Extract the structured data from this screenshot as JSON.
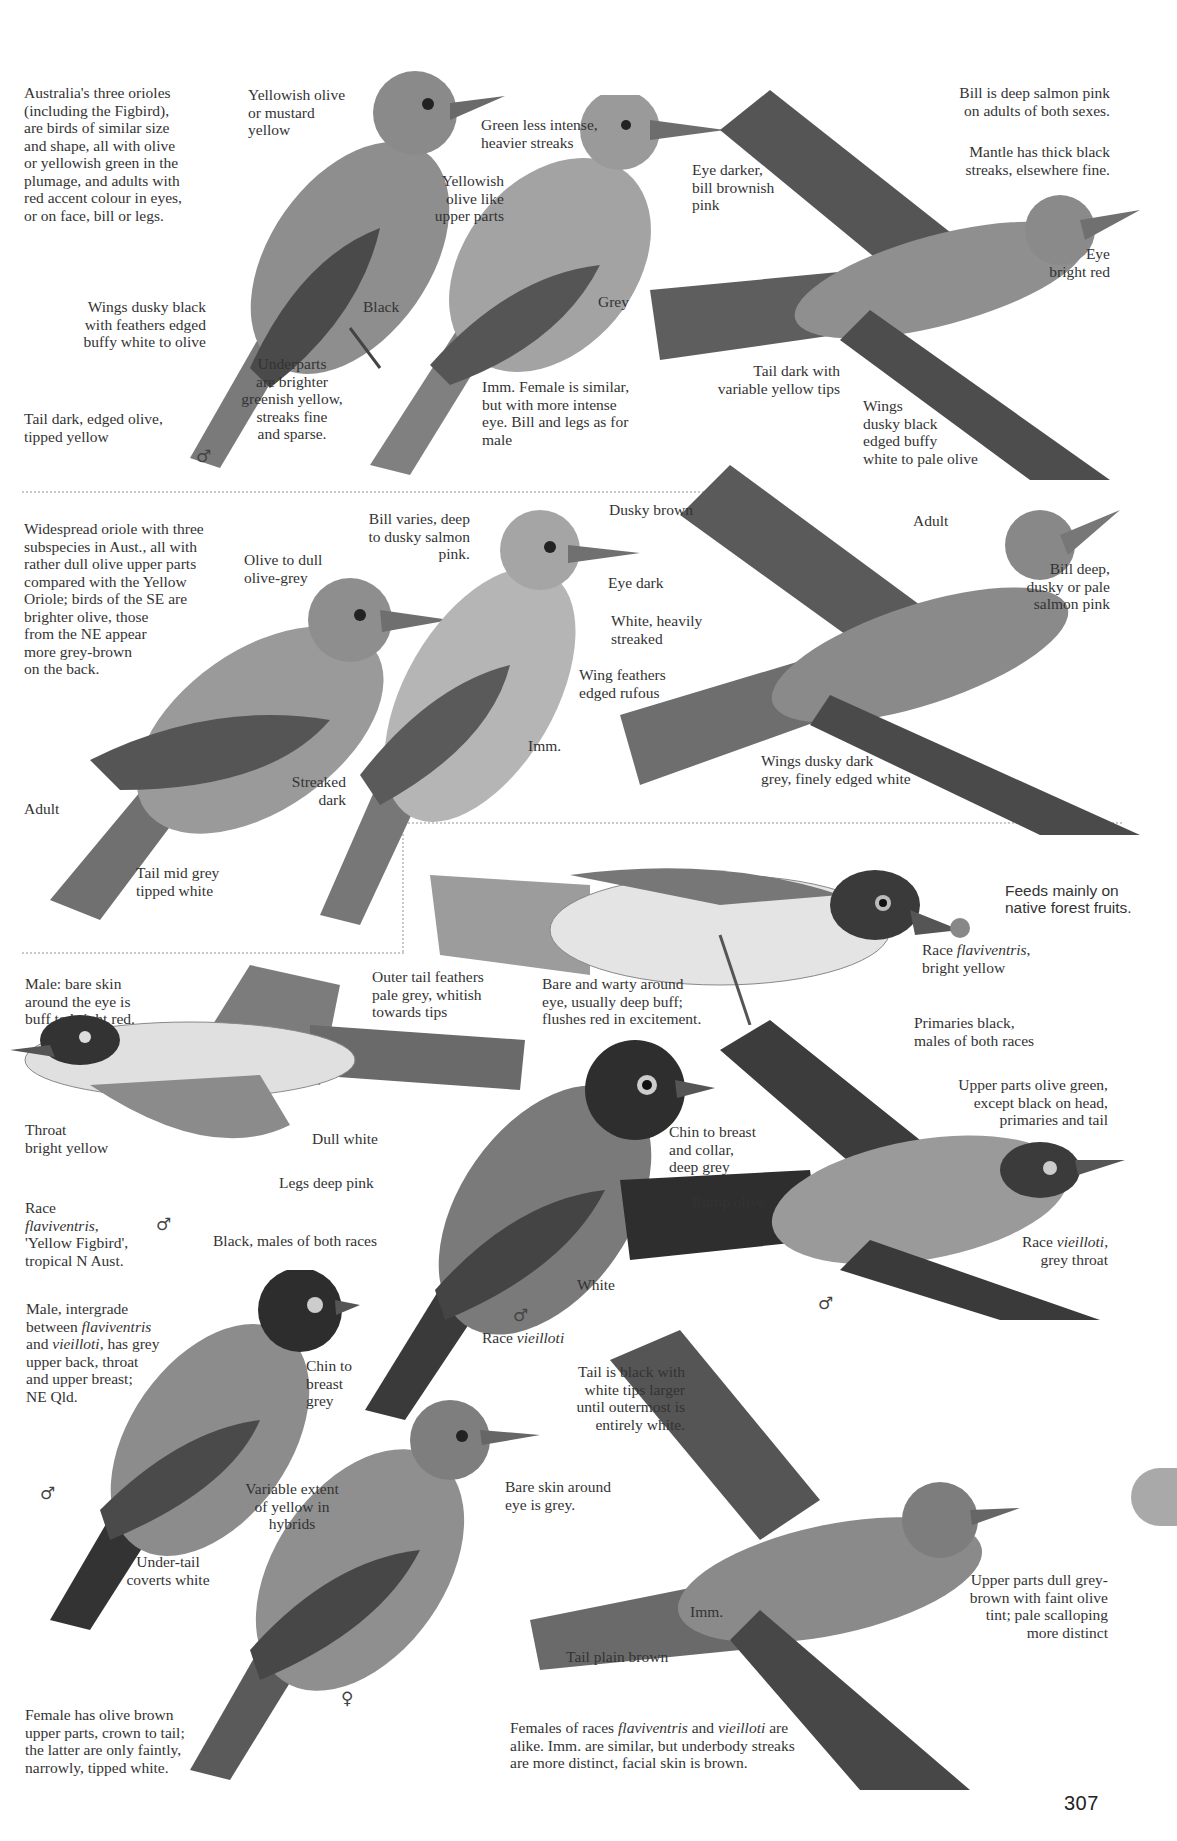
{
  "page": {
    "number": "307",
    "thumb_tab_color": "#a9a9a9",
    "ink_color": "#333333"
  },
  "section1": {
    "intro": "Australia's three orioles\n(including the Figbird),\nare birds of similar size\nand shape, all with olive\nor yellowish green in the\nplumage, and adults with\nred accent colour in eyes,\nor on face, bill or legs.",
    "labels": {
      "yellowish_olive": "Yellowish olive\nor mustard\nyellow",
      "wings_dusky": "Wings dusky black\nwith feathers edged\nbuffy white to olive",
      "black": "Black",
      "underparts": "Underparts\nare brighter\ngreenish yellow,\nstreaks fine\nand sparse.",
      "tail_dark": "Tail dark, edged olive,\ntipped yellow",
      "male_symbol": "♂",
      "green_less": "Green less intense,\nheavier streaks",
      "yellowish_olive_like": "Yellowish\nolive like\nupper parts",
      "eye_darker": "Eye darker,\nbill brownish\npink",
      "grey": "Grey",
      "imm_female": "Imm. Female is similar,\nbut with more intense\neye. Bill and legs as for\nmale",
      "bill_deep_salmon": "Bill is deep salmon pink\non adults of both sexes.",
      "mantle": "Mantle has thick black\nstreaks, elsewhere fine.",
      "eye_bright_red": "Eye\nbright red",
      "tail_dark_with": "Tail dark with\nvariable yellow tips",
      "wings_flight": "Wings\ndusky black\nedged buffy\nwhite to pale olive"
    }
  },
  "section2": {
    "intro": "Widespread oriole with three\nsubspecies in Aust., all with\nrather dull olive upper parts\ncompared with the Yellow\nOriole; birds of the SE are\nbrighter olive, those\nfrom the NE appear\nmore grey-brown\non the back.",
    "labels": {
      "olive_to_dull": "Olive to dull\nolive-grey",
      "bill_varies": "Bill varies, deep\nto dusky salmon\npink.",
      "streaked_dark": "Streaked\ndark",
      "adult_left": "Adult",
      "tail_mid_grey": "Tail mid grey\ntipped white",
      "dusky_brown": "Dusky brown",
      "eye_dark": "Eye dark",
      "white_heavily": "White, heavily\nstreaked",
      "wing_feathers": "Wing feathers\nedged rufous",
      "imm": "Imm.",
      "adult_flight": "Adult",
      "bill_deep_dusky": "Bill deep,\ndusky or pale\nsalmon pink",
      "wings_dusky_dark": "Wings dusky dark\ngrey, finely edged white"
    }
  },
  "section3": {
    "labels": {
      "feeds_mainly": "Feeds mainly on\nnative forest fruits.",
      "race_flaviventris_prefix": "Race ",
      "race_flaviventris_name": "flaviventris",
      "race_flaviventris_suffix": ",\nbright yellow",
      "outer_tail": "Outer tail feathers\npale grey, whitish\ntowards tips",
      "bare_warty": "Bare and warty around\neye, usually deep buff;\nflushes red in excitement.",
      "male_bare_skin": "Male: bare skin\naround the eye is\nbuff to bright red.",
      "throat": "Throat\nbright yellow",
      "dull_white": "Dull white",
      "legs_deep_pink": "Legs deep pink",
      "race_yellow_figbird_prefix": "Race\n",
      "race_yellow_figbird_name": "flaviventris",
      "race_yellow_figbird_suffix": ",\n'Yellow Figbird',\ntropical N Aust.",
      "male_symbol_flight": "♂",
      "black_males": "Black, males of both races",
      "chin_breast_collar": "Chin to breast\nand collar,\ndeep grey",
      "primaries_black": "Primaries black,\nmales of both races",
      "upper_parts_olive": "Upper parts olive green,\nexcept black on head,\nprimaries and tail",
      "rump_olive": "Rump olive",
      "race_vieilloti_grey_prefix": "Race ",
      "race_vieilloti_grey_name": "vieilloti",
      "race_vieilloti_grey_suffix": ",\ngrey throat",
      "male_symbol_vieilloti_flight": "♂",
      "male_intergrade_1": "Male, intergrade\nbetween ",
      "male_intergrade_name1": "flaviventris",
      "male_intergrade_2": "\nand ",
      "male_intergrade_name2": "vieilloti",
      "male_intergrade_3": ", has grey\nupper back, throat\nand upper breast;\nNE Qld.",
      "chin_to_breast_grey": "Chin to\nbreast\ngrey",
      "white": "White",
      "race_vieilloti_prefix": "Race ",
      "race_vieilloti_name": "vieilloti",
      "male_symbol_vieilloti": "♂",
      "male_symbol_intergrade": "♂",
      "tail_is_black": "Tail is black with\nwhite tips larger\nuntil outermost is\nentirely white.",
      "variable_extent": "Variable extent\nof yellow in\nhybrids",
      "under_tail": "Under-tail\ncoverts white",
      "bare_skin_grey": "Bare skin around\neye is grey.",
      "imm_flight": "Imm.",
      "upper_parts_dull": "Upper parts dull grey-\nbrown with faint olive\ntint; pale scalloping\nmore distinct",
      "tail_plain_brown": "Tail plain brown",
      "female_symbol": "♀",
      "female_olive_brown": "Female has olive brown\nupper parts, crown to tail;\nthe latter are only faintly,\nnarrowly, tipped white.",
      "females_races_1": "Females of races ",
      "females_races_name1": "flaviventris",
      "females_races_2": " and ",
      "females_races_name2": "vieilloti",
      "females_races_3": " are\nalike.  Imm. are similar, but underbody streaks\nare more distinct, facial skin is brown."
    }
  }
}
